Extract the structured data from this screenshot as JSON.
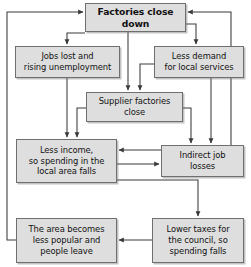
{
  "diagram": {
    "type": "flowchart",
    "colors": {
      "node_fill": "#dedede",
      "node_border": "#6f6f6f",
      "arrow": "#3a3a3a",
      "text": "#111111",
      "background": "#ffffff"
    },
    "nodes": [
      {
        "id": "factories-close-down",
        "label": "Factories close\ndown",
        "emphasis": true,
        "x": 85,
        "y": 3,
        "w": 101,
        "h": 29
      },
      {
        "id": "jobs-lost-rising-unemployment",
        "label": "Jobs lost and\nrising unemployment",
        "emphasis": false,
        "x": 15,
        "y": 46,
        "w": 105,
        "h": 32
      },
      {
        "id": "less-demand-local-services",
        "label": "Less demand\nfor local services",
        "emphasis": false,
        "x": 154,
        "y": 46,
        "w": 90,
        "h": 32
      },
      {
        "id": "supplier-factories-close",
        "label": "Supplier factories\nclose",
        "emphasis": false,
        "x": 86,
        "y": 92,
        "w": 97,
        "h": 30
      },
      {
        "id": "less-income-spending-falls",
        "label": "Less income,\nso spending in the\nlocal area falls",
        "emphasis": false,
        "x": 16,
        "y": 139,
        "w": 101,
        "h": 44
      },
      {
        "id": "indirect-job-losses",
        "label": "Indirect job\nlosses",
        "emphasis": false,
        "x": 161,
        "y": 145,
        "w": 83,
        "h": 32
      },
      {
        "id": "area-becomes-less-popular",
        "label": "The area becomes\nless popular and\npeople leave",
        "emphasis": false,
        "x": 16,
        "y": 218,
        "w": 101,
        "h": 45
      },
      {
        "id": "lower-taxes-council",
        "label": "Lower taxes for\nthe council, so\nspending falls",
        "emphasis": false,
        "x": 152,
        "y": 218,
        "w": 92,
        "h": 45
      }
    ],
    "edges": [
      {
        "id": "edge-factories-to-jobs-lost",
        "from": "factories-close-down",
        "to": "jobs-lost-rising-unemployment",
        "path": "M 85 33 L 67 33 L 67 44"
      },
      {
        "id": "edge-factories-to-supplier",
        "from": "factories-close-down",
        "to": "supplier-factories-close",
        "path": "M 128 32 L 128 90"
      },
      {
        "id": "edge-factories-to-less-demand",
        "from": "factories-close-down",
        "to": "less-demand-local-services",
        "path": "M 186 24 L 196 24 L 196 44"
      },
      {
        "id": "edge-less-demand-to-supplier",
        "from": "less-demand-local-services",
        "to": "supplier-factories-close",
        "path": "M 154 64 L 140 64 L 140 90"
      },
      {
        "id": "edge-jobs-lost-to-less-income",
        "from": "jobs-lost-rising-unemployment",
        "to": "less-income-spending-falls",
        "path": "M 67 78 L 67 137"
      },
      {
        "id": "edge-supplier-to-less-income",
        "from": "supplier-factories-close",
        "to": "less-income-spending-falls",
        "path": "M 86 108 L 77 108 L 77 137"
      },
      {
        "id": "edge-supplier-to-indirect",
        "from": "supplier-factories-close",
        "to": "indirect-job-losses",
        "path": "M 183 108 L 191 108 L 191 143"
      },
      {
        "id": "edge-less-demand-to-indirect",
        "from": "less-demand-local-services",
        "to": "indirect-job-losses",
        "path": "M 211 78 L 211 143"
      },
      {
        "id": "edge-indirect-to-less-income",
        "from": "indirect-job-losses",
        "to": "less-income-spending-falls",
        "path": "M 161 150 L 119 150"
      },
      {
        "id": "edge-less-income-to-indirect",
        "from": "less-income-spending-falls",
        "to": "indirect-job-losses",
        "path": "M 117 164 L 159 164"
      },
      {
        "id": "edge-less-income-to-lower-taxes",
        "from": "less-income-spending-falls",
        "to": "lower-taxes-council",
        "path": "M 117 180 L 198 180 L 198 216"
      },
      {
        "id": "edge-lower-taxes-to-area",
        "from": "lower-taxes-council",
        "to": "area-becomes-less-popular",
        "path": "M 152 240 L 119 240"
      },
      {
        "id": "edge-area-to-factories",
        "from": "area-becomes-less-popular",
        "to": "factories-close-down",
        "path": "M 16 240 L 7 240 L 7 12 L 83 12"
      },
      {
        "id": "edge-indirect-to-factories",
        "from": "indirect-job-losses",
        "to": "factories-close-down",
        "path": "M 231 145 L 231 12 L 188 12"
      }
    ]
  }
}
